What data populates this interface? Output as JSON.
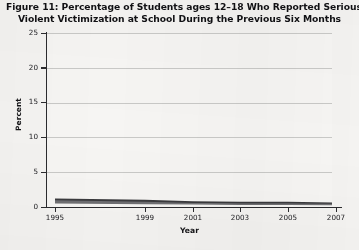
{
  "title": {
    "line1": "Figure 11: Percentage of Students ages 12–18 Who Reported Serious",
    "line2": "Violent Victimization at School During the Previous Six Months"
  },
  "chart_data": {
    "type": "line",
    "title": "Figure 11: Percentage of Students ages 12–18 Who Reported Serious Violent Victimization at School During the Previous Six Months",
    "xlabel": "Year",
    "ylabel": "Percent",
    "xlim": [
      1995,
      2007
    ],
    "ylim": [
      0,
      25
    ],
    "ytick_labels": [
      "0",
      "5",
      "10",
      "15",
      "20",
      "25"
    ],
    "ytick_values": [
      0,
      5,
      10,
      15,
      20,
      25
    ],
    "xtick_labels": [
      "1995",
      "1999",
      "2001",
      "2003",
      "2005",
      "2007"
    ],
    "xtick_values": [
      1995,
      1999,
      2001,
      2003,
      2005,
      2007
    ],
    "grid": "horizontal",
    "legend": "none",
    "x": [
      1995,
      1999,
      2001,
      2003,
      2005,
      2007
    ],
    "series": [
      {
        "name": "Serious violent victimization at school",
        "color": "#3a3a3d",
        "values": [
          1.1,
          0.9,
          0.7,
          0.6,
          0.6,
          0.5
        ]
      },
      {
        "name": "Serious violent victimization (lower band)",
        "color": "#6f6f72",
        "values": [
          0.6,
          0.5,
          0.45,
          0.4,
          0.4,
          0.35
        ]
      }
    ]
  },
  "colors": {
    "page_background": "#f4f3f1",
    "plot_background": "#f6f5f3",
    "axis": "#2b2b2e",
    "gridline": "#c9c9c7",
    "series_primary": "#3a3a3d",
    "text": "#17171a"
  }
}
